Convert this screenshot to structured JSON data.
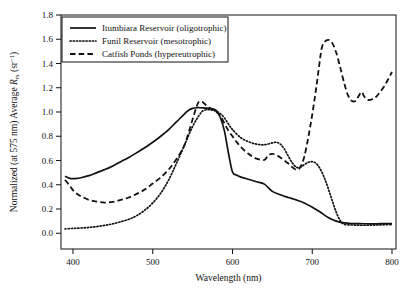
{
  "figure": {
    "name": "remote-sensing-reflectance-spectra",
    "background": "#ffffff",
    "line_color": "#111111"
  },
  "chart_data": {
    "type": "line",
    "title": "",
    "xlabel": "Wavelength (nm)",
    "ylabel_parts": {
      "prefix": "Normalized (at 575 nm) Average ",
      "symbol": "R",
      "subscript": "rs",
      "units_open": " (sr",
      "superscript": "-1",
      "units_close": ")"
    },
    "ylabel": "Normalized (at 575 nm) Average Rrs (sr-1)",
    "xlim": [
      385,
      805
    ],
    "ylim": [
      -0.13,
      1.8
    ],
    "xticks": [
      400,
      500,
      600,
      700,
      800
    ],
    "xtick_labels": [
      "400",
      "500",
      "600",
      "700",
      "800"
    ],
    "yticks": [
      0.0,
      0.2,
      0.4,
      0.6,
      0.8,
      1.0,
      1.2,
      1.4,
      1.6,
      1.8
    ],
    "ytick_labels": [
      "0.0",
      "0.2",
      "0.4",
      "0.6",
      "0.8",
      "1.0",
      "1.2",
      "1.4",
      "1.6",
      "1.8"
    ],
    "grid": false,
    "legend_position": "upper-left",
    "series": [
      {
        "name": "Itumbiara Reservoir (oligotrophic)",
        "style": "solid",
        "color": "#111111",
        "x": [
          390,
          395,
          400,
          405,
          410,
          420,
          430,
          440,
          450,
          460,
          470,
          480,
          490,
          500,
          510,
          520,
          530,
          540,
          545,
          550,
          555,
          560,
          565,
          570,
          575,
          580,
          585,
          590,
          595,
          600,
          605,
          610,
          620,
          630,
          640,
          650,
          660,
          665,
          670,
          675,
          680,
          690,
          700,
          710,
          720,
          730,
          740,
          750,
          760,
          770,
          780,
          790,
          800
        ],
        "y": [
          0.47,
          0.455,
          0.45,
          0.452,
          0.458,
          0.475,
          0.5,
          0.525,
          0.555,
          0.59,
          0.625,
          0.665,
          0.705,
          0.75,
          0.8,
          0.855,
          0.92,
          0.985,
          1.015,
          1.03,
          1.035,
          1.035,
          1.032,
          1.03,
          1.025,
          1.01,
          0.95,
          0.84,
          0.66,
          0.505,
          0.48,
          0.465,
          0.445,
          0.425,
          0.405,
          0.345,
          0.318,
          0.305,
          0.295,
          0.285,
          0.275,
          0.25,
          0.215,
          0.175,
          0.13,
          0.1,
          0.085,
          0.08,
          0.079,
          0.078,
          0.078,
          0.079,
          0.08
        ]
      },
      {
        "name": "Funil Reservoir (mesotrophic)",
        "style": "dotted",
        "color": "#111111",
        "x": [
          390,
          400,
          410,
          420,
          430,
          440,
          450,
          460,
          470,
          480,
          490,
          500,
          510,
          520,
          530,
          540,
          550,
          560,
          565,
          570,
          575,
          580,
          585,
          590,
          595,
          600,
          610,
          620,
          630,
          640,
          650,
          655,
          660,
          665,
          670,
          675,
          680,
          685,
          690,
          695,
          700,
          705,
          710,
          715,
          720,
          725,
          730,
          735,
          740,
          750,
          760,
          770,
          780,
          790,
          800
        ],
        "y": [
          0.035,
          0.04,
          0.043,
          0.048,
          0.055,
          0.065,
          0.078,
          0.095,
          0.115,
          0.145,
          0.19,
          0.25,
          0.33,
          0.44,
          0.58,
          0.73,
          0.88,
          0.99,
          1.015,
          1.02,
          1.015,
          1.005,
          0.985,
          0.95,
          0.9,
          0.855,
          0.79,
          0.755,
          0.735,
          0.73,
          0.745,
          0.75,
          0.735,
          0.695,
          0.635,
          0.58,
          0.545,
          0.545,
          0.565,
          0.585,
          0.59,
          0.575,
          0.53,
          0.46,
          0.37,
          0.27,
          0.175,
          0.105,
          0.075,
          0.068,
          0.066,
          0.066,
          0.068,
          0.07,
          0.072
        ]
      },
      {
        "name": "Catfish Ponds (hypereutrophic)",
        "style": "dashed",
        "color": "#111111",
        "x": [
          390,
          395,
          400,
          405,
          410,
          420,
          430,
          440,
          450,
          460,
          470,
          480,
          490,
          500,
          510,
          520,
          530,
          540,
          550,
          555,
          558,
          562,
          568,
          575,
          580,
          585,
          590,
          595,
          600,
          605,
          610,
          620,
          630,
          640,
          645,
          650,
          655,
          660,
          665,
          670,
          675,
          680,
          685,
          690,
          695,
          700,
          705,
          710,
          712,
          715,
          720,
          725,
          730,
          735,
          740,
          745,
          750,
          755,
          758,
          762,
          765,
          770,
          775,
          780,
          790,
          800
        ],
        "y": [
          0.44,
          0.4,
          0.355,
          0.325,
          0.305,
          0.275,
          0.26,
          0.253,
          0.258,
          0.275,
          0.295,
          0.325,
          0.36,
          0.41,
          0.46,
          0.525,
          0.615,
          0.73,
          0.94,
          1.045,
          1.085,
          1.085,
          1.05,
          1.02,
          1.0,
          0.965,
          0.905,
          0.845,
          0.8,
          0.755,
          0.715,
          0.655,
          0.615,
          0.605,
          0.645,
          0.655,
          0.645,
          0.625,
          0.6,
          0.575,
          0.545,
          0.525,
          0.545,
          0.63,
          0.79,
          0.98,
          1.2,
          1.45,
          1.53,
          1.575,
          1.595,
          1.57,
          1.49,
          1.37,
          1.24,
          1.135,
          1.09,
          1.095,
          1.13,
          1.165,
          1.13,
          1.1,
          1.105,
          1.125,
          1.21,
          1.33
        ]
      }
    ]
  },
  "legend": {
    "items": [
      {
        "label": "Itumbiara Reservoir (oligotrophic)",
        "style": "solid"
      },
      {
        "label": "Funil Reservoir (mesotrophic)",
        "style": "dotted"
      },
      {
        "label": "Catfish Ponds (hypereutrophic)",
        "style": "dashed"
      }
    ]
  }
}
